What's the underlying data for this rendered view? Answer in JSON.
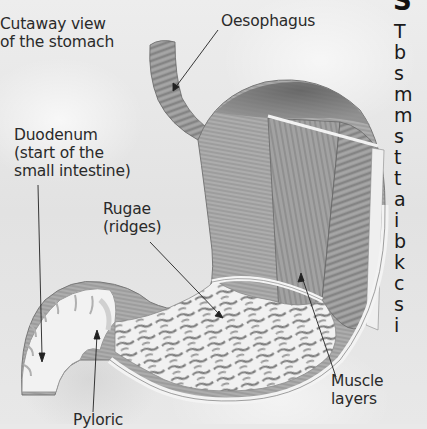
{
  "figure": {
    "title": "Cutaway view of the stomach",
    "labels": {
      "cutaway": "Cutaway view\nof the stomach",
      "oesophagus": "Oesophagus",
      "duodenum": "Duodenum\n(start of the\nsmall intestine)",
      "rugae": "Rugae\n(ridges)",
      "muscle_layers": "Muscle layers",
      "pyloric": "Pyloric"
    }
  },
  "article": {
    "heading_fragment": "S",
    "line_starts": [
      "T",
      "b",
      "s",
      "m",
      "m",
      "s",
      "t",
      "t",
      "a",
      "i",
      "b",
      "k",
      "c",
      "s",
      "i"
    ]
  },
  "colors": {
    "background": "#e9e9e9",
    "text": "#2a2a2a",
    "muscle": "#8a8a8a",
    "lining": "#f4f4f4"
  }
}
